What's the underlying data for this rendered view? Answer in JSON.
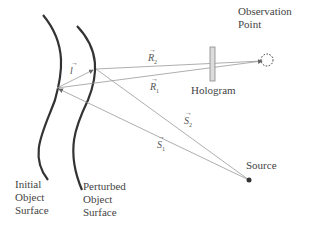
{
  "labels": {
    "observation_point": [
      "Observation",
      "Point"
    ],
    "hologram": "Hologram",
    "source": "Source",
    "initial_surface": [
      "Initial",
      "Object",
      "Surface"
    ],
    "perturbed_surface": [
      "Perturbed",
      "Object",
      "Surface"
    ]
  },
  "vectors": {
    "l": {
      "symbol": "l",
      "sub": ""
    },
    "r2": {
      "symbol": "R",
      "sub": "2"
    },
    "r1": {
      "symbol": "R",
      "sub": "1"
    },
    "s2": {
      "symbol": "S",
      "sub": "2"
    },
    "s1": {
      "symbol": "S",
      "sub": "1"
    },
    "arrow": "→"
  },
  "colors": {
    "curve": "#333333",
    "ray": "#9a9a9a",
    "text": "#444444",
    "hologram_fill": "#dcdcdc"
  }
}
